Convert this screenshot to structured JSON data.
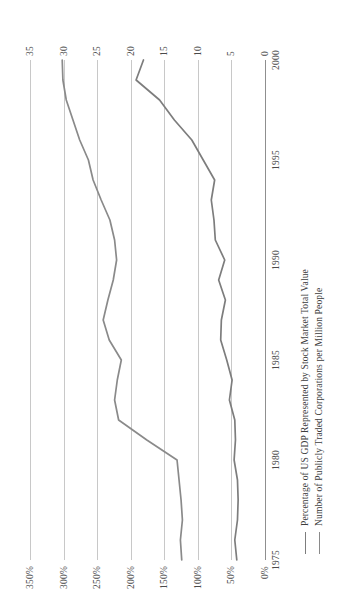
{
  "chart_data": {
    "type": "line",
    "title": "",
    "subtitle": "",
    "xlabel": "",
    "ylabel": "Percentage of US GDP Represented by Stock Market Total Value",
    "y2label": "Number of Publicly Traded Corporations per Million People",
    "grid": true,
    "orientation": "rotated-90-ccw",
    "legend_position": "bottom-left",
    "xlim": [
      1975,
      2000
    ],
    "ylim": [
      0,
      350
    ],
    "y2lim": [
      0,
      35
    ],
    "xticks": [
      "1975",
      "1980",
      "1985",
      "1990",
      "1995",
      "2000"
    ],
    "xtick_values": [
      1975,
      1980,
      1985,
      1990,
      1995,
      2000
    ],
    "yticks": [
      "0%",
      "50%",
      "100%",
      "150%",
      "200%",
      "250%",
      "300%",
      "350%"
    ],
    "ytick_values": [
      0,
      50,
      100,
      150,
      200,
      250,
      300,
      350
    ],
    "y2ticks": [
      "0",
      "5",
      "10",
      "15",
      "20",
      "25",
      "30",
      "35"
    ],
    "y2tick_values": [
      0,
      5,
      10,
      15,
      20,
      25,
      30,
      35
    ],
    "x": [
      1975,
      1976,
      1977,
      1978,
      1979,
      1980,
      1981,
      1982,
      1983,
      1984,
      1985,
      1986,
      1987,
      1988,
      1989,
      1990,
      1991,
      1992,
      1993,
      1994,
      1995,
      1996,
      1997,
      1998,
      1999,
      2000
    ],
    "series": [
      {
        "name": "Percentage of US GDP Represented by Stock Market Total Value",
        "axis": "left",
        "units": "percent",
        "color": "#7d7d7d",
        "values": [
          42,
          45,
          41,
          40,
          41,
          46,
          44,
          45,
          53,
          49,
          57,
          66,
          65,
          59,
          69,
          60,
          74,
          76,
          80,
          75,
          92,
          109,
          135,
          157,
          192,
          181
        ]
      },
      {
        "name": "Number of Publicly Traded Corporations per Million People",
        "axis": "right",
        "units": "corporations per million people",
        "color": "#8a8a8a",
        "values": [
          12.4,
          12.6,
          12.3,
          12.5,
          12.8,
          13.1,
          17.6,
          21.8,
          22.4,
          22.0,
          21.4,
          23.2,
          24.1,
          23.4,
          22.6,
          22.1,
          22.4,
          23.1,
          24.4,
          25.6,
          26.3,
          27.6,
          28.6,
          29.6,
          30.1,
          30.2
        ]
      }
    ]
  },
  "legend": {
    "items": [
      {
        "label": "Percentage of US GDP Represented by Stock Market Total Value",
        "color": "#7d7d7d"
      },
      {
        "label": "Number of Publicly Traded Corporations per Million People",
        "color": "#8a8a8a"
      }
    ]
  },
  "colors": {
    "background": "#ffffff",
    "gridline": "#c8c8c8",
    "axis": "#8f8f8f",
    "text": "#3d3d3d",
    "series_primary": "#7d7d7d",
    "series_secondary": "#8a8a8a"
  }
}
